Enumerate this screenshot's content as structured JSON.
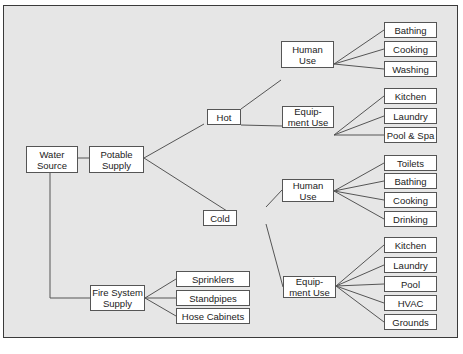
{
  "diagram": {
    "type": "tree",
    "colors": {
      "background": "#e6e6e6",
      "box_fill": "#ffffff",
      "line": "#555555",
      "border": "#3a3a3a"
    },
    "nodes": {
      "water_source": "Water\nSource",
      "potable_supply": "Potable\nSupply",
      "hot": "Hot",
      "cold": "Cold",
      "hot_human_use": "Human\nUse",
      "hot_equipment_use": "Equip-\nment Use",
      "cold_human_use": "Human\nUse",
      "cold_equipment_use": "Equip-\nment Use",
      "hot_human_bathing": "Bathing",
      "hot_human_cooking": "Cooking",
      "hot_human_washing": "Washing",
      "hot_equip_kitchen": "Kitchen",
      "hot_equip_laundry": "Laundry",
      "hot_equip_pool_spa": "Pool & Spa",
      "cold_human_toilets": "Toilets",
      "cold_human_bathing": "Bathing",
      "cold_human_cooking": "Cooking",
      "cold_human_drinking": "Drinking",
      "cold_equip_kitchen": "Kitchen",
      "cold_equip_laundry": "Laundry",
      "cold_equip_pool": "Pool",
      "cold_equip_hvac": "HVAC",
      "cold_equip_grounds": "Grounds",
      "fire_system_supply": "Fire System\nSupply",
      "fire_sprinklers": "Sprinklers",
      "fire_standpipes": "Standpipes",
      "fire_hose_cabinets": "Hose Cabinets"
    }
  }
}
